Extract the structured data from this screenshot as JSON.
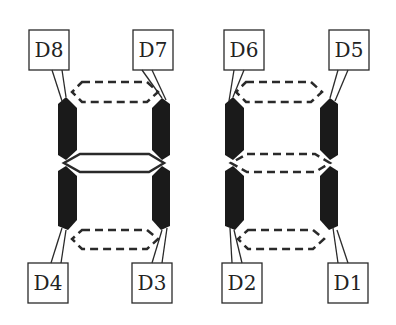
{
  "diagram": {
    "colors": {
      "solid_segment": "#1a1a1a",
      "outline": "#2a2a2a",
      "background": "#ffffff"
    },
    "labels": {
      "D8": "D8",
      "D7": "D7",
      "D6": "D6",
      "D5": "D5",
      "D4": "D4",
      "D3": "D3",
      "D2": "D2",
      "D1": "D1"
    },
    "legend": {
      "solid_black": "active vertical segments",
      "solid_outline": "middle segment (left digit)",
      "dashed_outline": "inactive segments"
    }
  }
}
